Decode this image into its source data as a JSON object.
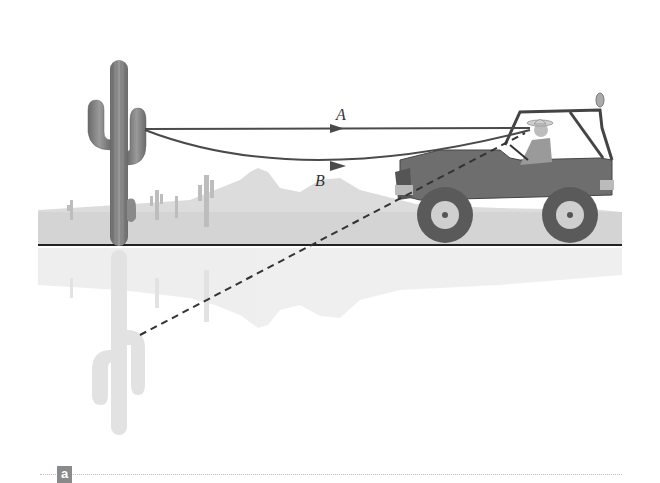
{
  "figure": {
    "panel_label": "a",
    "rays": [
      {
        "id": "A",
        "label": "A",
        "type": "straight",
        "style": "solid"
      },
      {
        "id": "B",
        "label": "B",
        "type": "curved",
        "style": "solid"
      },
      {
        "id": "virtual",
        "label": "",
        "type": "straight",
        "style": "dashed"
      }
    ],
    "colors": {
      "ray": "#4a4a4a",
      "cactus": "#7a7a7a",
      "cactus_reflection": "#d2d2d2",
      "background_scenery": "#d9d9d9",
      "ground_line": "#222222",
      "jeep_body": "#6e6e6e",
      "panel_tag": "#8a8a8a"
    }
  }
}
